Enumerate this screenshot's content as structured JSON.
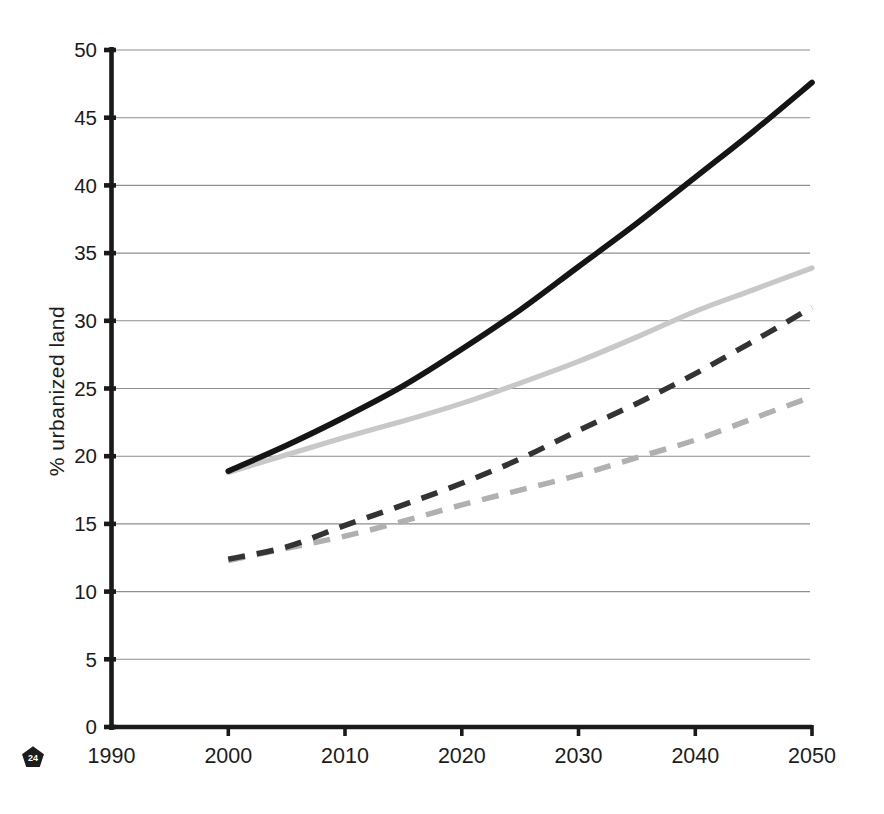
{
  "chart_data": {
    "type": "line",
    "title": "",
    "xlabel": "",
    "ylabel": "% urbanized land",
    "xlim": [
      1990,
      2050
    ],
    "ylim": [
      0,
      50
    ],
    "xticks": [
      1990,
      2000,
      2010,
      2020,
      2030,
      2040,
      2050
    ],
    "yticks": [
      0,
      5,
      10,
      15,
      20,
      25,
      30,
      35,
      40,
      45,
      50
    ],
    "grid": true,
    "legend": "none",
    "x": [
      2000,
      2005,
      2010,
      2015,
      2020,
      2025,
      2030,
      2035,
      2040,
      2045,
      2050
    ],
    "series": [
      {
        "name": "solid-black",
        "line_style": "solid",
        "color": "#151515",
        "width": 5.7,
        "values": [
          18.9,
          20.8,
          22.9,
          25.2,
          27.9,
          30.8,
          34.0,
          37.2,
          40.6,
          44.0,
          47.6
        ]
      },
      {
        "name": "solid-light-gray",
        "line_style": "solid",
        "color": "#c8c8c8",
        "width": 5.2,
        "values": [
          18.8,
          20.1,
          21.4,
          22.6,
          23.9,
          25.4,
          27.0,
          28.8,
          30.7,
          32.3,
          33.9
        ]
      },
      {
        "name": "dashed-dark-gray",
        "line_style": "dashed",
        "color": "#333333",
        "width": 5.5,
        "values": [
          12.4,
          13.3,
          14.9,
          16.4,
          18.0,
          19.8,
          21.9,
          23.9,
          26.1,
          28.5,
          31.0
        ]
      },
      {
        "name": "dashed-light-gray",
        "line_style": "dashed",
        "color": "#b0b0b0",
        "width": 5.5,
        "values": [
          12.3,
          13.2,
          14.1,
          15.2,
          16.4,
          17.5,
          18.6,
          19.9,
          21.2,
          22.8,
          24.4
        ]
      }
    ]
  },
  "badge": {
    "label": "24"
  },
  "colors": {
    "background": "#ffffff",
    "axis": "#1a1a1a",
    "grid": "#8e8e8e",
    "text": "#1c1c1c",
    "badge_fill": "#1c1c1c",
    "badge_text": "#ffffff"
  }
}
